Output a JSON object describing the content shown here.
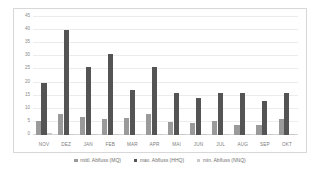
{
  "chart_data": {
    "type": "bar",
    "title": "",
    "xlabel": "",
    "ylabel": "",
    "ylim": [
      0,
      45
    ],
    "yticks": [
      45,
      40,
      35,
      30,
      25,
      20,
      15,
      10,
      5,
      0
    ],
    "grid": true,
    "legend_position": "bottom",
    "categories": [
      "NOV",
      "DEZ",
      "JAN",
      "FEB",
      "MAR",
      "APR",
      "MAI",
      "JUN",
      "JUL",
      "AUG",
      "SEP",
      "OKT"
    ],
    "series": [
      {
        "name": "mittl. Abfluss (MQ)",
        "color": "#9a9a9a",
        "values": [
          5.5,
          8.0,
          7.0,
          6.0,
          6.5,
          8.0,
          5.0,
          4.5,
          5.5,
          4.0,
          4.0,
          6.0
        ]
      },
      {
        "name": "max. Abfluss (HHQ)",
        "color": "#545454",
        "values": [
          20.0,
          40.0,
          26.0,
          31.0,
          17.0,
          26.0,
          16.0,
          14.0,
          16.0,
          16.0,
          13.0,
          16.0
        ]
      },
      {
        "name": "min. Abfluss (NNQ)",
        "color": "#c9c9c9",
        "values": [
          0.6,
          0.5,
          0.5,
          0.4,
          0.4,
          0.5,
          0.4,
          0.3,
          0.3,
          0.3,
          0.3,
          0.4
        ]
      }
    ]
  },
  "legend": {
    "items": [
      {
        "label": "mittl. Abfluss (MQ)",
        "swatch": "mq"
      },
      {
        "label": "max. Abfluss (HHQ)",
        "swatch": "hhq"
      },
      {
        "label": "min. Abfluss (NNQ)",
        "swatch": "nnq"
      }
    ]
  },
  "colors": {
    "mq": "#9a9a9a",
    "hhq": "#545454",
    "nnq": "#c9c9c9",
    "grid": "#ececec",
    "axis_text": "#8a8a8a",
    "card_border": "#d8d8d8"
  }
}
